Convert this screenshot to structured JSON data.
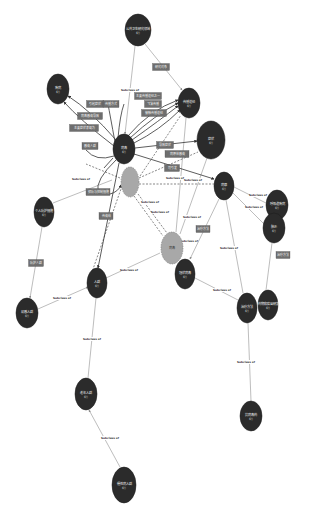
{
  "diagram": {
    "type": "knowledge-graph",
    "colors": {
      "node_dark": "#2b2b2b",
      "node_gray": "#a8a8a8",
      "edge_solid": "#3a3a3a",
      "edge_light": "#9a9a9a",
      "edge_box": "#6e6e6e",
      "background": "#ffffff"
    },
    "subclass_label": "Subclass of",
    "nodes": [
      {
        "id": "n1",
        "label": "公共卫生研究领域",
        "sub": "概念",
        "x": 138,
        "y": 30,
        "rx": 13,
        "ry": 16,
        "kind": "dark"
      },
      {
        "id": "n2",
        "label": "疾病",
        "sub": "概念",
        "x": 58,
        "y": 89,
        "rx": 11,
        "ry": 15,
        "kind": "dark"
      },
      {
        "id": "n3",
        "label": "传播途径",
        "sub": "概念",
        "x": 189,
        "y": 103,
        "rx": 11,
        "ry": 15,
        "kind": "dark"
      },
      {
        "id": "n4",
        "label": "病毒",
        "sub": "概念",
        "x": 124,
        "y": 149,
        "rx": 11,
        "ry": 15,
        "kind": "dark"
      },
      {
        "id": "n5",
        "label": "症状",
        "sub": "概念",
        "x": 211,
        "y": 140,
        "rx": 14,
        "ry": 19,
        "kind": "dark"
      },
      {
        "id": "n6",
        "label": "",
        "sub": "",
        "x": 130,
        "y": 182,
        "rx": 9,
        "ry": 15,
        "kind": "gray"
      },
      {
        "id": "n7",
        "label": "病原",
        "sub": "概念",
        "x": 224,
        "y": 186,
        "rx": 10,
        "ry": 14,
        "kind": "dark"
      },
      {
        "id": "n8",
        "label": "个人防护措施",
        "sub": "概念",
        "x": 44,
        "y": 212,
        "rx": 10,
        "ry": 15,
        "kind": "dark"
      },
      {
        "id": "n9",
        "label": "呼吸道疾病",
        "sub": "概念",
        "x": 277,
        "y": 205,
        "rx": 11,
        "ry": 15,
        "kind": "dark"
      },
      {
        "id": "n10",
        "label": "肺炎",
        "sub": "概念",
        "x": 274,
        "y": 228,
        "rx": 11,
        "ry": 15,
        "kind": "dark"
      },
      {
        "id": "n11",
        "label": "病毒",
        "sub": "",
        "x": 172,
        "y": 248,
        "rx": 11,
        "ry": 16,
        "kind": "gray"
      },
      {
        "id": "n12",
        "label": "冠状病毒",
        "sub": "概念",
        "x": 185,
        "y": 274,
        "rx": 10,
        "ry": 15,
        "kind": "dark"
      },
      {
        "id": "n13",
        "label": "人群",
        "sub": "概念",
        "x": 97,
        "y": 283,
        "rx": 10,
        "ry": 15,
        "kind": "dark"
      },
      {
        "id": "n14",
        "label": "易感人群",
        "sub": "概念",
        "x": 27,
        "y": 313,
        "rx": 11,
        "ry": 15,
        "kind": "dark"
      },
      {
        "id": "n15",
        "label": "治疗方法",
        "sub": "概念",
        "x": 247,
        "y": 308,
        "rx": 10,
        "ry": 15,
        "kind": "dark"
      },
      {
        "id": "n16",
        "label": "药物和疫苗研发",
        "sub": "概念",
        "x": 268,
        "y": 305,
        "rx": 10,
        "ry": 15,
        "kind": "dark"
      },
      {
        "id": "n17",
        "label": "老年人群",
        "sub": "概念",
        "x": 86,
        "y": 394,
        "rx": 11,
        "ry": 16,
        "kind": "dark"
      },
      {
        "id": "n18",
        "label": "抗病毒药",
        "sub": "概念",
        "x": 251,
        "y": 416,
        "rx": 11,
        "ry": 15,
        "kind": "dark"
      },
      {
        "id": "n19",
        "label": "慢性病人群",
        "sub": "概念",
        "x": 124,
        "y": 485,
        "rx": 12,
        "ry": 18,
        "kind": "dark"
      }
    ],
    "relation_boxes": [
      {
        "label": "研究对象",
        "x": 161,
        "y": 67,
        "w": 17,
        "h": 7
      },
      {
        "label": "引起症状",
        "x": 95,
        "y": 104,
        "w": 17,
        "h": 7
      },
      {
        "label": "传播方式",
        "x": 111,
        "y": 104,
        "w": 16,
        "h": 7
      },
      {
        "label": "主要传播途径之一",
        "x": 148,
        "y": 96,
        "w": 27,
        "h": 7
      },
      {
        "label": "飞沫传播",
        "x": 153,
        "y": 104,
        "w": 17,
        "h": 7
      },
      {
        "label": "接触传播途径",
        "x": 154,
        "y": 113,
        "w": 25,
        "h": 7
      },
      {
        "label": "病毒感染导致",
        "x": 90,
        "y": 116,
        "w": 25,
        "h": 7
      },
      {
        "label": "主要症状表现为",
        "x": 84,
        "y": 128,
        "w": 29,
        "h": 7
      },
      {
        "label": "感染人群",
        "x": 90,
        "y": 146,
        "w": 16,
        "h": 7
      },
      {
        "label": "导致症状",
        "x": 165,
        "y": 145,
        "w": 17,
        "h": 7
      },
      {
        "label": "病原体感染",
        "x": 177,
        "y": 154,
        "w": 24,
        "h": 7
      },
      {
        "label": "可引发",
        "x": 172,
        "y": 168,
        "w": 15,
        "h": 7
      },
      {
        "label": "预防与控制措施",
        "x": 98,
        "y": 192,
        "w": 24,
        "h": 7
      },
      {
        "label": "传染给",
        "x": 106,
        "y": 216,
        "w": 14,
        "h": 7
      },
      {
        "label": "防护人群",
        "x": 36,
        "y": 263,
        "w": 15,
        "h": 7
      },
      {
        "label": "治疗方法",
        "x": 203,
        "y": 229,
        "w": 14,
        "h": 7
      },
      {
        "label": "治疗方法",
        "x": 283,
        "y": 255,
        "w": 14,
        "h": 7
      }
    ],
    "subclass_edges": [
      {
        "x": 130,
        "y": 90
      },
      {
        "x": 81,
        "y": 179
      },
      {
        "x": 150,
        "y": 202
      },
      {
        "x": 160,
        "y": 212
      },
      {
        "x": 175,
        "y": 178
      },
      {
        "x": 193,
        "y": 180
      },
      {
        "x": 192,
        "y": 217
      },
      {
        "x": 189,
        "y": 241
      },
      {
        "x": 258,
        "y": 195
      },
      {
        "x": 254,
        "y": 207
      },
      {
        "x": 229,
        "y": 248
      },
      {
        "x": 129,
        "y": 270
      },
      {
        "x": 62,
        "y": 298
      },
      {
        "x": 222,
        "y": 290
      },
      {
        "x": 92,
        "y": 339
      },
      {
        "x": 246,
        "y": 362
      },
      {
        "x": 110,
        "y": 438
      }
    ]
  }
}
